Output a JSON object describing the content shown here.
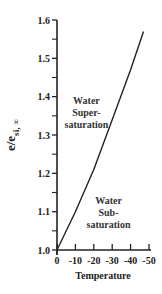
{
  "chart_data": {
    "type": "line",
    "title": "",
    "xlabel": "Temperature",
    "ylabel": {
      "main": "e/e",
      "subscript": "si, ∞"
    },
    "xlim": [
      0,
      -50
    ],
    "ylim": [
      1.0,
      1.6
    ],
    "x_ticks": [
      0,
      -10,
      -20,
      -30,
      -40,
      -50
    ],
    "x_tick_labels": [
      "0",
      "-10",
      "-20",
      "-30",
      "-40",
      "-50"
    ],
    "y_ticks": [
      1.0,
      1.1,
      1.2,
      1.3,
      1.4,
      1.5,
      1.6
    ],
    "y_tick_labels": [
      "1.0",
      "1.1",
      "1.2",
      "1.3",
      "1.4",
      "1.5",
      "1.6"
    ],
    "y_minor_step": 0.05,
    "grid": false,
    "legend": "none",
    "series": [
      {
        "name": "e_sw/e_si",
        "x": [
          0,
          -10,
          -20,
          -30,
          -40,
          -47
        ],
        "y": [
          1.0,
          1.1,
          1.21,
          1.34,
          1.47,
          1.57
        ]
      }
    ],
    "annotations": [
      {
        "lines": [
          "Water",
          "Super-",
          "saturation"
        ],
        "x": -16,
        "y": 1.38
      },
      {
        "lines": [
          "Water",
          "Sub-",
          "saturation"
        ],
        "x": -28,
        "y": 1.12
      }
    ]
  }
}
